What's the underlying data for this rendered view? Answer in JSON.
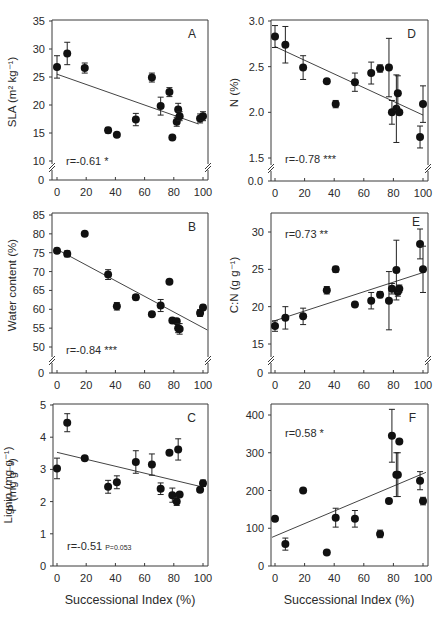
{
  "figure": {
    "xlabel": "Successional Index (%)",
    "x_ticks": [
      0,
      20,
      40,
      60,
      80,
      100
    ]
  },
  "chart_data": [
    {
      "id": "A",
      "type": "scatter",
      "panel_letter": "A",
      "ylabel": "SLA (m² kg⁻¹)",
      "xlabel": "",
      "y_ticks": [
        10,
        15,
        20,
        25,
        30,
        35
      ],
      "y_break": true,
      "y_zero_label": "0",
      "ylim": [
        10,
        35
      ],
      "xlim": [
        0,
        100
      ],
      "stat_text": "r=-0.61 *",
      "stat_sub": "",
      "stat_pos": "bottom-left",
      "letter_pos": "top-right",
      "trendline": {
        "x": [
          0,
          97
        ],
        "y": [
          25.5,
          16.6
        ]
      },
      "points": [
        {
          "x": 0,
          "y": 26.8,
          "err": 2.0
        },
        {
          "x": 7,
          "y": 29.2,
          "err": 2.0
        },
        {
          "x": 19,
          "y": 26.6,
          "err": 0.9
        },
        {
          "x": 35,
          "y": 15.5,
          "err": 0.5
        },
        {
          "x": 41,
          "y": 14.7,
          "err": 0.3
        },
        {
          "x": 54,
          "y": 17.4,
          "err": 1.1
        },
        {
          "x": 65,
          "y": 24.9,
          "err": 0.8
        },
        {
          "x": 71,
          "y": 19.8,
          "err": 1.6
        },
        {
          "x": 77,
          "y": 22.3,
          "err": 0.8
        },
        {
          "x": 79,
          "y": 14.2,
          "err": 0.3
        },
        {
          "x": 82,
          "y": 17.0,
          "err": 0.8
        },
        {
          "x": 83,
          "y": 19.2,
          "err": 1.1
        },
        {
          "x": 84,
          "y": 18.0,
          "err": 0.8
        },
        {
          "x": 98,
          "y": 17.6,
          "err": 0.8
        },
        {
          "x": 100,
          "y": 18.0,
          "err": 0.8
        }
      ]
    },
    {
      "id": "D",
      "type": "scatter",
      "panel_letter": "D",
      "ylabel": "N (%)",
      "xlabel": "",
      "y_ticks": [
        1.5,
        2.0,
        2.5,
        3.0
      ],
      "y_tick_labels": [
        "1.5",
        "2.0",
        "2.5",
        "3.0"
      ],
      "y_break": true,
      "y_zero_label": "0.0",
      "ylim": [
        1.5,
        3.0
      ],
      "xlim": [
        0,
        100
      ],
      "stat_text": "r=-0.78 ***",
      "stat_sub": "",
      "stat_pos": "bottom-left",
      "letter_pos": "top-right",
      "trendline": {
        "x": [
          0,
          100
        ],
        "y": [
          2.72,
          1.97
        ]
      },
      "points": [
        {
          "x": 0,
          "y": 2.83,
          "err": 0.12
        },
        {
          "x": 7,
          "y": 2.74,
          "err": 0.2
        },
        {
          "x": 19,
          "y": 2.49,
          "err": 0.13
        },
        {
          "x": 35,
          "y": 2.34,
          "err": 0.02
        },
        {
          "x": 41,
          "y": 2.09,
          "err": 0.04
        },
        {
          "x": 54,
          "y": 2.33,
          "err": 0.1
        },
        {
          "x": 65,
          "y": 2.43,
          "err": 0.12
        },
        {
          "x": 71,
          "y": 2.48,
          "err": 0.04
        },
        {
          "x": 77,
          "y": 2.49,
          "err": 0.32
        },
        {
          "x": 79,
          "y": 2.0,
          "err": 0.13
        },
        {
          "x": 82,
          "y": 2.04,
          "err": 0.37
        },
        {
          "x": 83,
          "y": 2.21,
          "err": 0.19
        },
        {
          "x": 84,
          "y": 2.0,
          "err": 0.02
        },
        {
          "x": 98,
          "y": 1.73,
          "err": 0.12
        },
        {
          "x": 100,
          "y": 2.09,
          "err": 0.2
        }
      ]
    },
    {
      "id": "B",
      "type": "scatter",
      "panel_letter": "B",
      "ylabel": "Water content (%)",
      "xlabel": "",
      "y_ticks": [
        50,
        55,
        60,
        65,
        70,
        75,
        80,
        85
      ],
      "y_break": true,
      "y_zero_label": "0",
      "ylim": [
        47,
        85
      ],
      "xlim": [
        0,
        100
      ],
      "stat_text": "r=-0.84 ***",
      "stat_sub": "",
      "stat_pos": "bottom-left",
      "letter_pos": "top-right",
      "trendline": {
        "x": [
          -2,
          103
        ],
        "y": [
          76.3,
          54.5
        ]
      },
      "points": [
        {
          "x": 0,
          "y": 75.5,
          "err": 0.5
        },
        {
          "x": 7,
          "y": 74.7,
          "err": 0.8
        },
        {
          "x": 19,
          "y": 80.0,
          "err": 0.3
        },
        {
          "x": 35,
          "y": 69.2,
          "err": 1.3
        },
        {
          "x": 41,
          "y": 60.8,
          "err": 1.0
        },
        {
          "x": 54,
          "y": 63.2,
          "err": 0.7
        },
        {
          "x": 65,
          "y": 58.7,
          "err": 0.6
        },
        {
          "x": 71,
          "y": 61.0,
          "err": 1.6
        },
        {
          "x": 77,
          "y": 67.3,
          "err": 0.4
        },
        {
          "x": 79,
          "y": 57.0,
          "err": 0.4
        },
        {
          "x": 82,
          "y": 56.8,
          "err": 0.4
        },
        {
          "x": 83,
          "y": 55.0,
          "err": 1.2
        },
        {
          "x": 84,
          "y": 54.8,
          "err": 1.4
        },
        {
          "x": 98,
          "y": 59.0,
          "err": 0.9
        },
        {
          "x": 100,
          "y": 60.5,
          "err": 0.6
        }
      ]
    },
    {
      "id": "E",
      "type": "scatter",
      "panel_letter": "E",
      "ylabel": "C:N (g g⁻¹)",
      "xlabel": "",
      "y_ticks": [
        15,
        20,
        25,
        30
      ],
      "y_break": true,
      "y_zero_label": "0",
      "ylim": [
        13,
        32.5
      ],
      "xlim": [
        0,
        100
      ],
      "stat_text": "r=0.73 **",
      "stat_sub": "",
      "stat_pos": "top-left",
      "letter_pos": "top-right",
      "trendline": {
        "x": [
          -2,
          102
        ],
        "y": [
          18.0,
          24.7
        ]
      },
      "points": [
        {
          "x": 0,
          "y": 17.4,
          "err": 0.7
        },
        {
          "x": 7,
          "y": 18.5,
          "err": 1.5
        },
        {
          "x": 19,
          "y": 18.7,
          "err": 1.1
        },
        {
          "x": 35,
          "y": 22.2,
          "err": 0.5
        },
        {
          "x": 41,
          "y": 25.0,
          "err": 0.4
        },
        {
          "x": 54,
          "y": 20.3,
          "err": 0.2
        },
        {
          "x": 65,
          "y": 20.8,
          "err": 1.1
        },
        {
          "x": 71,
          "y": 21.6,
          "err": 0.4
        },
        {
          "x": 77,
          "y": 20.8,
          "err": 3.9
        },
        {
          "x": 79,
          "y": 22.4,
          "err": 0.7
        },
        {
          "x": 82,
          "y": 24.9,
          "err": 4.0
        },
        {
          "x": 83,
          "y": 22.0,
          "err": 0.6
        },
        {
          "x": 84,
          "y": 22.4,
          "err": 0.5
        },
        {
          "x": 98,
          "y": 28.4,
          "err": 2.0
        },
        {
          "x": 100,
          "y": 25.0,
          "err": 3.1
        }
      ]
    },
    {
      "id": "C",
      "type": "scatter",
      "panel_letter": "C",
      "ylabel": "P (mg g⁻¹)",
      "xlabel": "Successional Index (%)",
      "y_ticks": [
        0,
        1,
        2,
        3,
        4,
        5
      ],
      "y_break": false,
      "y_zero_label": "",
      "ylim": [
        0,
        5
      ],
      "xlim": [
        0,
        100
      ],
      "stat_text": "r=-0.51",
      "stat_sub": "P=0.053",
      "stat_pos": "bottom-left",
      "letter_pos": "top-right",
      "trendline": {
        "x": [
          0,
          100
        ],
        "y": [
          3.53,
          2.45
        ]
      },
      "points": [
        {
          "x": 0,
          "y": 3.03,
          "err": 0.32
        },
        {
          "x": 7,
          "y": 4.45,
          "err": 0.28
        },
        {
          "x": 19,
          "y": 3.35,
          "err": 0.05
        },
        {
          "x": 35,
          "y": 2.46,
          "err": 0.2
        },
        {
          "x": 41,
          "y": 2.6,
          "err": 0.2
        },
        {
          "x": 54,
          "y": 3.23,
          "err": 0.35
        },
        {
          "x": 65,
          "y": 3.15,
          "err": 0.33
        },
        {
          "x": 71,
          "y": 2.4,
          "err": 0.18
        },
        {
          "x": 77,
          "y": 3.52,
          "err": 0.05
        },
        {
          "x": 79,
          "y": 2.2,
          "err": 0.22
        },
        {
          "x": 82,
          "y": 2.0,
          "err": 0.12
        },
        {
          "x": 83,
          "y": 3.62,
          "err": 0.33
        },
        {
          "x": 84,
          "y": 2.22,
          "err": 0.06
        },
        {
          "x": 98,
          "y": 2.37,
          "err": 0.06
        },
        {
          "x": 100,
          "y": 2.57,
          "err": 0.1
        }
      ]
    },
    {
      "id": "F",
      "type": "scatter",
      "panel_letter": "F",
      "ylabel": "Lignin (mg g⁻¹)",
      "xlabel": "Successional Index (%)",
      "y_ticks": [
        0,
        100,
        200,
        300,
        400
      ],
      "y_break": false,
      "y_zero_label": "",
      "ylim": [
        0,
        430
      ],
      "xlim": [
        0,
        100
      ],
      "stat_text": "r=0.58 *",
      "stat_sub": "",
      "stat_pos": "top-left",
      "letter_pos": "top-right",
      "trendline": {
        "x": [
          -2,
          102
        ],
        "y": [
          76,
          248
        ]
      },
      "points": [
        {
          "x": 0,
          "y": 125,
          "err": 5
        },
        {
          "x": 7,
          "y": 58,
          "err": 16
        },
        {
          "x": 19,
          "y": 200,
          "err": 4
        },
        {
          "x": 35,
          "y": 36,
          "err": 4
        },
        {
          "x": 41,
          "y": 128,
          "err": 25
        },
        {
          "x": 54,
          "y": 125,
          "err": 22
        },
        {
          "x": 71,
          "y": 85,
          "err": 10
        },
        {
          "x": 77,
          "y": 172,
          "err": 6
        },
        {
          "x": 79,
          "y": 345,
          "err": 70
        },
        {
          "x": 82,
          "y": 242,
          "err": 58
        },
        {
          "x": 83,
          "y": 242,
          "err": 58
        },
        {
          "x": 84,
          "y": 330,
          "err": 5
        },
        {
          "x": 98,
          "y": 226,
          "err": 24
        },
        {
          "x": 100,
          "y": 172,
          "err": 10
        }
      ]
    }
  ]
}
